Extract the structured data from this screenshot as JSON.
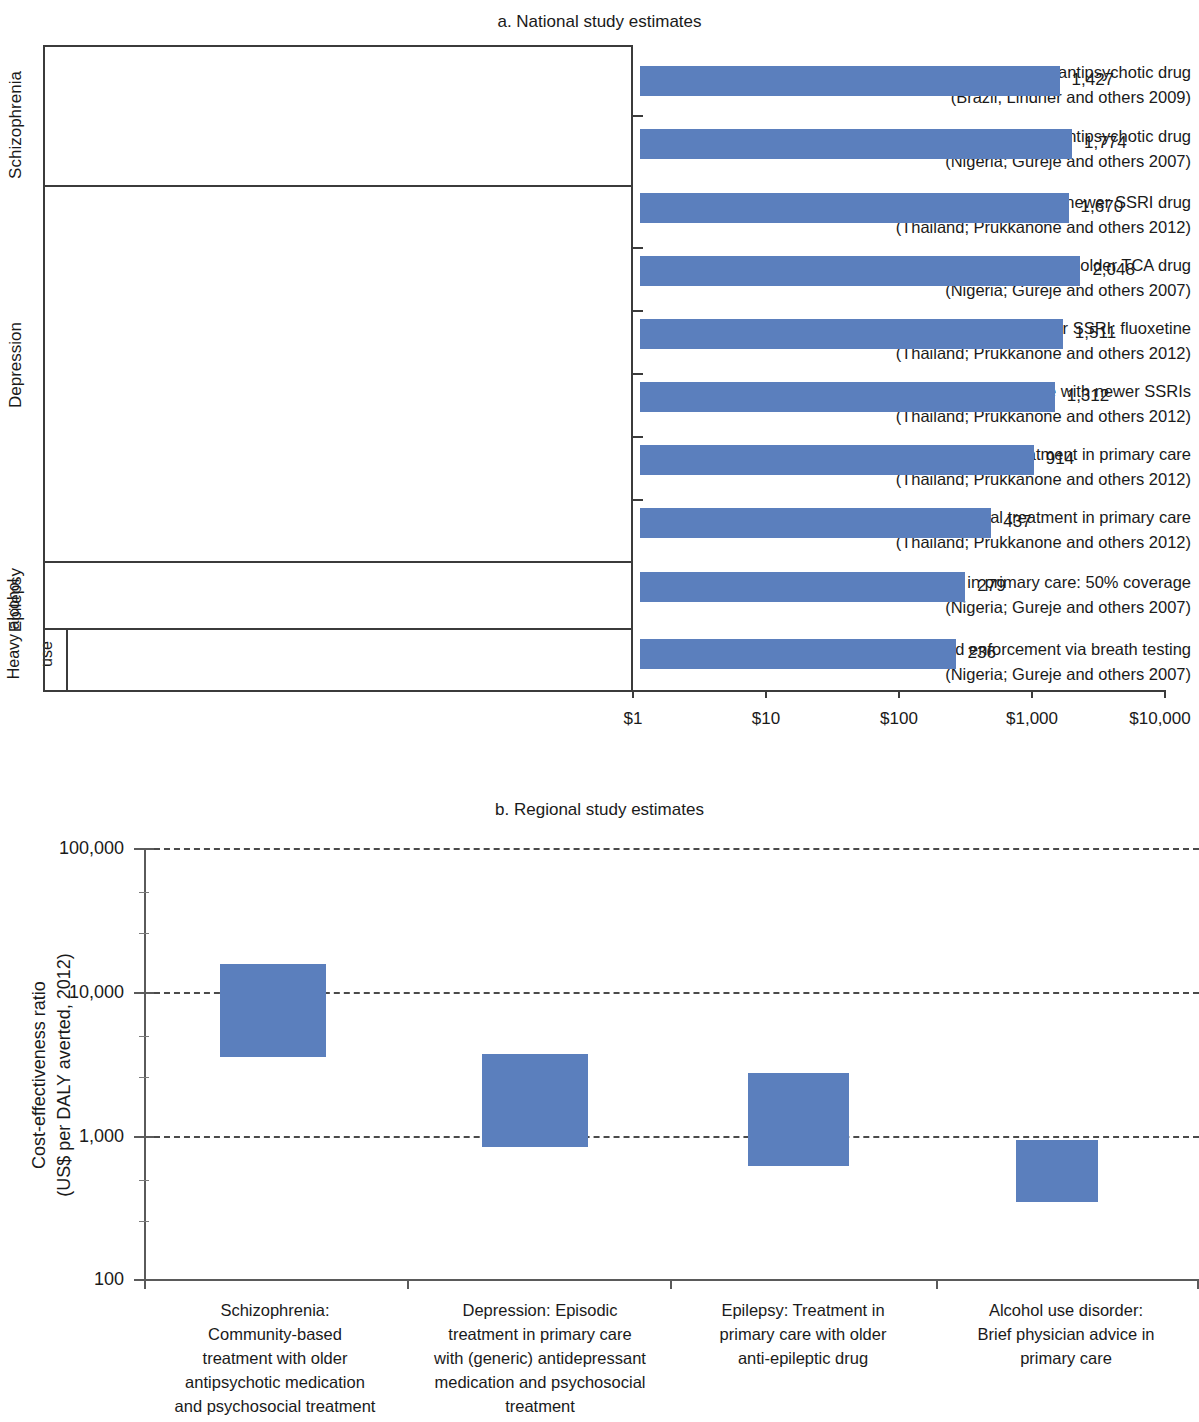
{
  "figure": {
    "panel_a_title": "a. National study estimates",
    "panel_b_title": "b. Regional study estimates",
    "bar_color": "#5b7fbd"
  },
  "chart_data": [
    {
      "type": "bar",
      "title": "a. National study estimates",
      "orientation": "horizontal",
      "xlabel": "",
      "ylabel": "",
      "xscale": "log",
      "xlim": [
        1,
        10000
      ],
      "xticks": [
        1,
        10,
        100,
        1000,
        10000
      ],
      "xticklabels": [
        "$1",
        "$10",
        "$100",
        "$1,000",
        "$10,000"
      ],
      "grid": false,
      "groups": [
        {
          "label": "Schizophrenia",
          "rows": [
            0,
            1
          ]
        },
        {
          "label": "Depression",
          "rows": [
            2,
            3,
            4,
            5,
            6,
            7
          ]
        },
        {
          "label": "Epilepsy",
          "rows": [
            8
          ]
        },
        {
          "label": "Heavy alcohol use",
          "rows": [
            9
          ]
        }
      ],
      "categories": [
        {
          "line1": "Facility-based treatment with older (neuroleptic) antipsychotic drug",
          "line2": "(Brazil; Lindner and others 2009)"
        },
        {
          "line1": "Facility-based psychosocial treatment with neuroleptic antipsychotic drug",
          "line2": "(Nigeria; Gureje and others 2007)"
        },
        {
          "line1": "Episodic treatment in primary care with newer SSRI drug",
          "line2": "(Thailand; Prukkanone and others 2012)"
        },
        {
          "line1": "Episodic treatment in primary care with older TCA drug",
          "line2": "(Nigeria; Gureje and others 2007)"
        },
        {
          "line1": "Maintenance treatment in primary care with newer SSRI: fluoxetine",
          "line2": "(Thailand; Prukkanone and others 2012)"
        },
        {
          "line1": "Continuation treatment in primary care with newer SSRIs",
          "line2": "(Thailand; Prukkanone and others 2012)"
        },
        {
          "line1": "Episodic psychosocial treatment in primary care",
          "line2": "(Thailand; Prukkanone and others 2012)"
        },
        {
          "line1": "Maintenance psychosocial treatment in primary care",
          "line2": "(Thailand; Prukkanone and others 2012)"
        },
        {
          "line1": "Older anti-epileptic drug in primary care: 50% coverage",
          "line2": "(Nigeria; Gureje and others 2007)"
        },
        {
          "line1": "Drunk driving laws and enforcement via breath testing",
          "line2": "(Nigeria; Gureje and others 2007)"
        }
      ],
      "values": [
        1427,
        1774,
        1670,
        2048,
        1511,
        1312,
        914,
        437,
        279,
        236
      ],
      "value_labels": [
        "1,427",
        "1,774",
        "1,670",
        "2,048",
        "1,511",
        "1,312",
        "914",
        "437",
        "279",
        "236"
      ]
    },
    {
      "type": "bar",
      "subtype": "floating-range",
      "title": "b. Regional study estimates",
      "ylabel": "Cost-effectiveness ratio\n(US$ per DALY averted, 2012)",
      "yscale": "log",
      "ylim": [
        100,
        100000
      ],
      "yticks": [
        100,
        1000,
        10000,
        100000
      ],
      "yticklabels": [
        "100",
        "1,000",
        "10,000",
        "100,000"
      ],
      "grid": "horizontal-dashed",
      "categories": [
        "Schizophrenia:\nCommunity-based\ntreatment with older\nantipsychotic medication\nand psychosocial treatment",
        "Depression: Episodic\ntreatment in primary care\nwith (generic) antidepressant\nmedication and psychosocial\ntreatment",
        "Epilepsy: Treatment in\nprimary care with older\nanti-epileptic drug",
        "Alcohol use disorder:\nBrief physician advice in\nprimary care"
      ],
      "ranges": [
        {
          "low": 3480,
          "high": 15500
        },
        {
          "low": 825,
          "high": 3650
        },
        {
          "low": 610,
          "high": 2700
        },
        {
          "low": 345,
          "high": 930
        }
      ]
    }
  ],
  "panel_a": {
    "title": "a. National study estimates",
    "group_labels": [
      "Schizophrenia",
      "Depression",
      "Epilepsy",
      "Heavy alcohol",
      "use"
    ],
    "rows": [
      {
        "line1": "Facility-based treatment with older (neuroleptic) antipsychotic drug",
        "line2": "(Brazil; Lindner and others 2009)",
        "value": "1,427"
      },
      {
        "line1": "Facility-based psychosocial treatment with neuroleptic antipsychotic drug",
        "line2": "(Nigeria; Gureje and others 2007)",
        "value": "1,774"
      },
      {
        "line1": "Episodic treatment in primary care with newer SSRI drug",
        "line2": "(Thailand; Prukkanone and others 2012)",
        "value": "1,670"
      },
      {
        "line1": "Episodic treatment in primary care with older TCA drug",
        "line2": "(Nigeria; Gureje and others 2007)",
        "value": "2,048"
      },
      {
        "line1": "Maintenance treatment in primary care with newer SSRI: fluoxetine",
        "line2": "(Thailand; Prukkanone and others 2012)",
        "value": "1,511"
      },
      {
        "line1": "Continuation treatment in primary care with newer SSRIs",
        "line2": "(Thailand; Prukkanone and others 2012)",
        "value": "1,312"
      },
      {
        "line1": "Episodic psychosocial treatment in primary care",
        "line2": "(Thailand; Prukkanone and others 2012)",
        "value": "914"
      },
      {
        "line1": "Maintenance psychosocial treatment in primary care",
        "line2": "(Thailand; Prukkanone and others 2012)",
        "value": "437"
      },
      {
        "line1": "Older anti-epileptic drug in primary care: 50% coverage",
        "line2": "(Nigeria; Gureje and others 2007)",
        "value": "279"
      },
      {
        "line1": "Drunk driving laws and enforcement via breath testing",
        "line2": "(Nigeria; Gureje and others 2007)",
        "value": "236"
      }
    ],
    "xticklabels": [
      "$1",
      "$10",
      "$100",
      "$1,000",
      "$10,000"
    ]
  },
  "panel_b": {
    "title": "b. Regional study estimates",
    "ylabel": "Cost-effectiveness ratio\n(US$ per DALY averted, 2012)",
    "yticklabels": [
      "100,000",
      "10,000",
      "1,000",
      "100"
    ],
    "category_labels": [
      "Schizophrenia:\nCommunity-based\ntreatment with older\nantipsychotic medication\nand psychosocial treatment",
      "Depression: Episodic\ntreatment in primary care\nwith (generic) antidepressant\nmedication and psychosocial\ntreatment",
      "Epilepsy: Treatment in\nprimary care with older\nanti-epileptic drug",
      "Alcohol use disorder:\nBrief physician advice in\nprimary care"
    ]
  }
}
